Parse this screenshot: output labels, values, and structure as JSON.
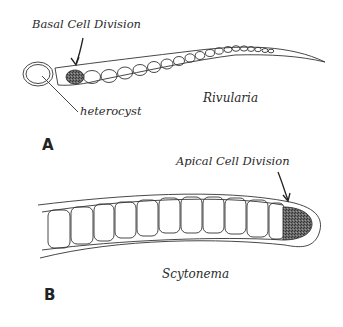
{
  "panel_a": {
    "letter": "A",
    "organism": "Rivularia",
    "labels": {
      "division": "Basal Cell Division",
      "heterocyst": "heterocyst"
    }
  },
  "panel_b": {
    "letter": "B",
    "organism": "Scytonema",
    "labels": {
      "division": "Apical Cell Division"
    }
  },
  "colors": {
    "line": "#333333",
    "dividing_cell_fill": "#555555",
    "background": "#ffffff"
  }
}
